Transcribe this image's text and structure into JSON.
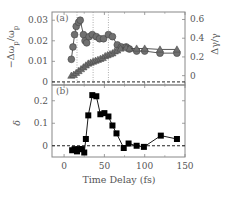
{
  "chart_data": [
    {
      "id": "a",
      "panel_label": "(a)",
      "type": "scatter",
      "xlabel": "Time Delay (fs)",
      "xlim": [
        -15,
        150
      ],
      "xticks": [
        0,
        50,
        100,
        150
      ],
      "ylabel": "−Δω_p/ω_p",
      "ylim": [
        -0.0015,
        0.034
      ],
      "yticks": [
        0,
        0.01,
        0.02,
        0.03
      ],
      "ytick_labels": [
        "0",
        "0.01",
        "0.02",
        "0.03"
      ],
      "y2label": "Δγ/γ",
      "y2lim": [
        -0.1,
        0.68
      ],
      "y2ticks": [
        0,
        0.2,
        0.4,
        0.6
      ],
      "y2tick_labels": [
        "0",
        "0.2",
        "0.4",
        "0.6"
      ],
      "reference_line_y": 0,
      "vertical_dotted_lines_x": [
        16,
        36,
        55
      ],
      "series": [
        {
          "name": "−Δω_p/ω_p",
          "axis": "left",
          "marker": "circle",
          "color": "#707070",
          "x": [
            9,
            11,
            13,
            15,
            18,
            20,
            24,
            26,
            28,
            31,
            35,
            40,
            44,
            49,
            55,
            60,
            66,
            71,
            77,
            81,
            90,
            100,
            119,
            140
          ],
          "y": [
            0.011,
            0.017,
            0.023,
            0.027,
            0.029,
            0.03,
            0.023,
            0.02,
            0.019,
            0.022,
            0.023,
            0.022,
            0.021,
            0.021,
            0.023,
            0.022,
            0.018,
            0.017,
            0.017,
            0.016,
            0.015,
            0.015,
            0.014,
            0.014
          ]
        },
        {
          "name": "Δγ/γ",
          "axis": "right",
          "marker": "triangle",
          "color": "#707070",
          "x": [
            9,
            12,
            15,
            18,
            21,
            24,
            27,
            30,
            33,
            36,
            39,
            42,
            45,
            48,
            51,
            54,
            57,
            60,
            63,
            66,
            70,
            77,
            81,
            90,
            100,
            119,
            140
          ],
          "y": [
            0.0,
            0.01,
            0.03,
            0.05,
            0.07,
            0.09,
            0.11,
            0.13,
            0.14,
            0.15,
            0.16,
            0.17,
            0.18,
            0.19,
            0.21,
            0.22,
            0.23,
            0.24,
            0.26,
            0.27,
            0.29,
            0.3,
            0.29,
            0.29,
            0.29,
            0.28,
            0.28
          ]
        }
      ]
    },
    {
      "id": "b",
      "panel_label": "(b)",
      "type": "line",
      "xlabel": "Time Delay (fs)",
      "xlim": [
        -15,
        150
      ],
      "xticks": [
        0,
        50,
        100,
        150
      ],
      "xtick_labels": [
        "0",
        "50",
        "100",
        "150"
      ],
      "ylabel": "δ",
      "ylim": [
        -0.05,
        0.27
      ],
      "yticks": [
        0,
        0.1,
        0.2
      ],
      "ytick_labels": [
        "0",
        "0.1",
        "0.2"
      ],
      "reference_line_y": 0,
      "series": [
        {
          "name": "δ",
          "marker": "square",
          "color": "#000000",
          "x": [
            10,
            13,
            16,
            19,
            22,
            25,
            27,
            30,
            35,
            40,
            45,
            50,
            55,
            60,
            65,
            74,
            80,
            90,
            99,
            120,
            140
          ],
          "y": [
            -0.02,
            -0.015,
            -0.025,
            -0.015,
            -0.015,
            -0.03,
            0.03,
            0.135,
            0.225,
            0.22,
            0.14,
            0.145,
            0.13,
            0.09,
            0.055,
            -0.01,
            0.01,
            0.0,
            -0.005,
            0.045,
            0.03
          ]
        }
      ]
    }
  ]
}
